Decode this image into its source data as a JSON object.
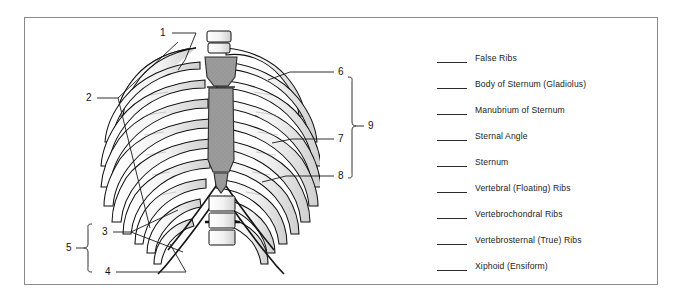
{
  "figure": {
    "border_color": "#8a8a8a",
    "background": "#ffffff",
    "ink_color": "#1a1a1a",
    "sternum_fill": "#9b9b9b"
  },
  "legend": {
    "items": [
      {
        "label": "False Ribs"
      },
      {
        "label": "Body of Sternum (Gladiolus)"
      },
      {
        "label": "Manubrium of Sternum"
      },
      {
        "label": "Sternal Angle"
      },
      {
        "label": "Sternum"
      },
      {
        "label": "Vertebral (Floating) Ribs"
      },
      {
        "label": "Vertebrochondral Ribs"
      },
      {
        "label": "Vertebrosternal (True) Ribs"
      },
      {
        "label": "Xiphoid (Ensiform)"
      }
    ]
  },
  "callouts": [
    {
      "number": "1"
    },
    {
      "number": "2"
    },
    {
      "number": "3"
    },
    {
      "number": "4"
    },
    {
      "number": "5"
    },
    {
      "number": "6"
    },
    {
      "number": "7"
    },
    {
      "number": "8"
    },
    {
      "number": "9"
    }
  ],
  "brackets": [
    {
      "number": "5",
      "spans": [
        "3",
        "4"
      ]
    },
    {
      "number": "9",
      "spans": [
        "6",
        "7",
        "8"
      ]
    }
  ]
}
